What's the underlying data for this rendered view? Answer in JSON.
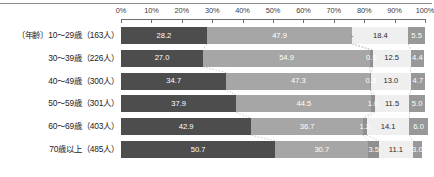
{
  "chart_data": {
    "type": "bar",
    "orientation": "horizontal",
    "stacked": true,
    "normalized": true,
    "title": "",
    "xlabel": "",
    "ylabel": "",
    "xlim": [
      0,
      100
    ],
    "grid": false,
    "legend": "none",
    "axis_ticks": [
      "0%",
      "10%",
      "20%",
      "30%",
      "40%",
      "50%",
      "60%",
      "70%",
      "80%",
      "90%",
      "100%"
    ],
    "axis_tick_values": [
      0,
      10,
      20,
      30,
      40,
      50,
      60,
      70,
      80,
      90,
      100
    ],
    "categories": [
      "〔年齢〕10～29歳（163人）",
      "30～39歳（226人）",
      "40～49歳（300人）",
      "50～59歳（301人）",
      "60～69歳（403人）",
      "70歳以上（485人）"
    ],
    "series": [
      {
        "name": "series-1",
        "color": "#4d4d4d",
        "values": [
          28.2,
          27.0,
          34.7,
          37.9,
          42.9,
          50.7
        ],
        "labels": [
          "28.2",
          "27.0",
          "34.7",
          "37.9",
          "42.9",
          "50.7"
        ]
      },
      {
        "name": "series-2",
        "color": "#a6a6a6",
        "values": [
          47.9,
          54.9,
          47.3,
          44.5,
          36.7,
          30.7
        ],
        "labels": [
          "47.9",
          "54.9",
          "47.3",
          "44.5",
          "36.7",
          "30.7"
        ]
      },
      {
        "name": "series-3",
        "color": "#8f8f8f",
        "values": [
          0.0,
          0.9,
          0.3,
          1.0,
          1.2,
          3.5
        ],
        "labels": [
          "-",
          "0.9",
          "0.3",
          "1.0",
          "1.2",
          "3.5"
        ]
      },
      {
        "name": "series-4",
        "color": "#efefef",
        "values": [
          18.4,
          12.5,
          13.0,
          11.5,
          14.1,
          11.1
        ],
        "labels": [
          "18.4",
          "12.5",
          "13.0",
          "11.5",
          "14.1",
          "11.1"
        ]
      },
      {
        "name": "series-5",
        "color": "#989898",
        "values": [
          5.5,
          4.4,
          4.7,
          5.0,
          6.0,
          3.0
        ],
        "labels": [
          "5.5",
          "4.4",
          "4.7",
          "5.0",
          "6.0",
          "3.0"
        ]
      }
    ]
  },
  "colors": {
    "segment_1": "#4d4d4d",
    "segment_2": "#a6a6a6",
    "segment_3": "#8f8f8f",
    "segment_4": "#efefef",
    "segment_5": "#989898",
    "axis": "#6f6f6f",
    "text_dark": "#1d1d1d",
    "text_light": "#ffffff"
  }
}
